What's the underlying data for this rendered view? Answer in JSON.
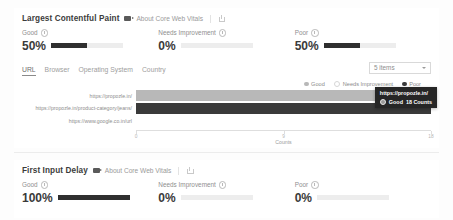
{
  "sections": [
    {
      "id": "lcp",
      "title": "Largest Contentful Paint",
      "about_label": "About Core Web Vitals",
      "metrics": [
        {
          "label": "Good",
          "value": "50%",
          "percent": 50
        },
        {
          "label": "Needs Improvement",
          "value": "0%",
          "percent": 0
        },
        {
          "label": "Poor",
          "value": "50%",
          "percent": 50
        }
      ]
    },
    {
      "id": "fid",
      "title": "First Input Delay",
      "about_label": "About Core Web Vitals",
      "metrics": [
        {
          "label": "Good",
          "value": "100%",
          "percent": 100
        },
        {
          "label": "Needs Improvement",
          "value": "0%",
          "percent": 0
        },
        {
          "label": "Poor",
          "value": "0%",
          "percent": 0
        }
      ]
    }
  ],
  "breakdown": {
    "tabs": [
      {
        "label": "URL",
        "active": true
      },
      {
        "label": "Browser",
        "active": false
      },
      {
        "label": "Operating System",
        "active": false
      },
      {
        "label": "Country",
        "active": false
      }
    ],
    "items_select": {
      "value": "5 items"
    },
    "legend": [
      {
        "label": "Good",
        "color": "#b8b8b8",
        "filled": true
      },
      {
        "label": "Needs Improvement",
        "color": "#d6d6d6",
        "filled": false
      },
      {
        "label": "Poor",
        "color": "#3a3a3a",
        "filled": true
      }
    ]
  },
  "tooltip": {
    "title": "https://propozle.in/",
    "series_label": "Good",
    "series_value": "18 Counts"
  },
  "chart_data": {
    "type": "bar",
    "orientation": "horizontal",
    "stacked": true,
    "title": "",
    "xlabel": "Counts",
    "ylabel": "",
    "xlim": [
      0,
      18
    ],
    "xticks": [
      0,
      9,
      18
    ],
    "xticklabels": [
      "0",
      "9",
      "18"
    ],
    "grid": false,
    "legend_position": "top-right",
    "categories": [
      "https://propozle.in/",
      "https://propozle.in/product-category/jeans/",
      "https://www.google.co.in/url"
    ],
    "series": [
      {
        "name": "Good",
        "color": "#b8b8b8",
        "values": [
          18,
          0,
          0
        ]
      },
      {
        "name": "Needs Improvement",
        "color": "#d6d6d6",
        "values": [
          0,
          0,
          0
        ]
      },
      {
        "name": "Poor",
        "color": "#3a3a3a",
        "values": [
          0,
          18,
          0
        ]
      }
    ]
  }
}
